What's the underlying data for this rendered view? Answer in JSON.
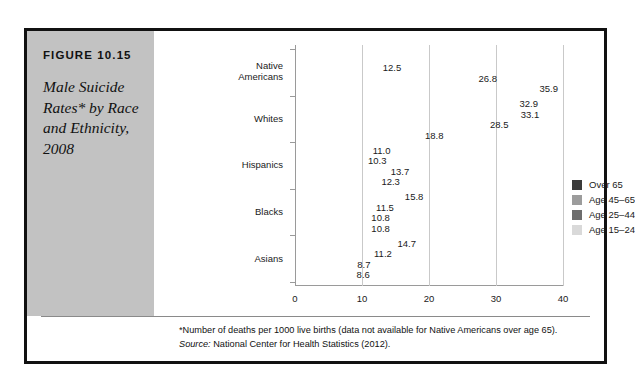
{
  "figure": {
    "number": "FIGURE 10.15",
    "title": "Male Suicide Rates* by Race and Ethnicity, 2008"
  },
  "footnote": {
    "note": "*Number of deaths per 1000 live births (data not available for Native Americans over age 65).",
    "source_label": "Source:",
    "source_text": " National Center for Health Statistics (2012)."
  },
  "chart_data": {
    "type": "bar",
    "orientation": "horizontal",
    "title": "Male Suicide Rates* by Race and Ethnicity, 2008",
    "xlabel": "",
    "ylabel": "",
    "xlim": [
      0,
      40
    ],
    "xticks": [
      0,
      10,
      20,
      30,
      40
    ],
    "grid": true,
    "legend_position": "right-inside",
    "categories": [
      "Native Americans",
      "Whites",
      "Hispanics",
      "Blacks",
      "Asians"
    ],
    "series": [
      {
        "name": "Over 65",
        "color": "#3b3b3b",
        "values": [
          null,
          32.9,
          11.0,
          15.8,
          14.7
        ],
        "labels": [
          "",
          "32.9",
          "11.0",
          "15.8",
          "14.7"
        ]
      },
      {
        "name": "Age 45–65",
        "color": "#9c9c9c",
        "values": [
          12.5,
          33.1,
          10.3,
          11.5,
          11.2
        ],
        "labels": [
          "12.5",
          "33.1",
          "10.3",
          "11.5",
          "11.2"
        ]
      },
      {
        "name": "Age 25–44",
        "color": "#6d6d6d",
        "values": [
          26.8,
          28.5,
          13.7,
          10.8,
          8.7
        ],
        "labels": [
          "26.8",
          "28.5",
          "13.7",
          "10.8",
          "8.7"
        ]
      },
      {
        "name": "Age 15–24",
        "color": "#d9d9d9",
        "values": [
          35.9,
          18.8,
          12.3,
          10.8,
          8.6
        ],
        "labels": [
          "35.9",
          "18.8",
          "12.3",
          "10.8",
          "8.6"
        ]
      }
    ]
  }
}
